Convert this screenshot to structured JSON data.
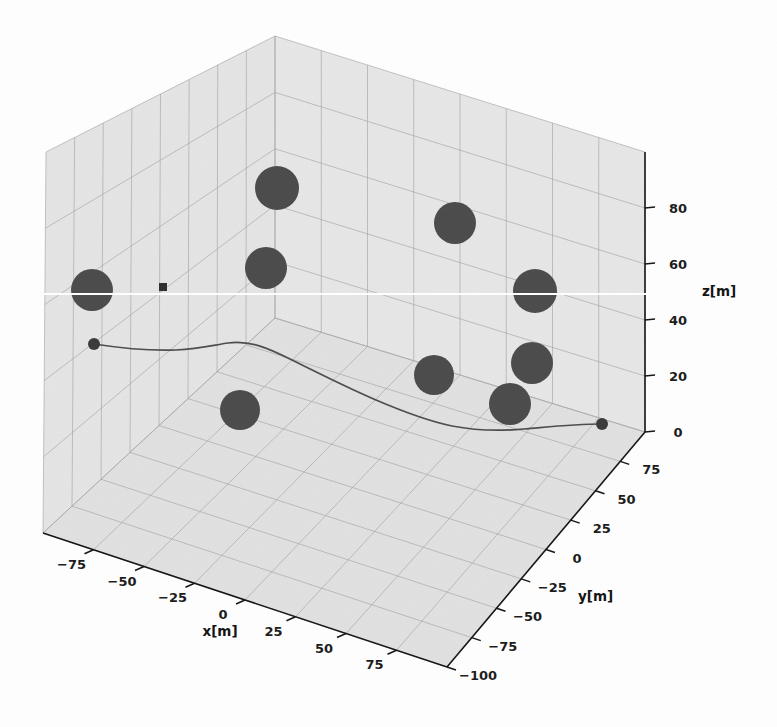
{
  "figure": {
    "kind": "matplotlib-3d-axes",
    "background_color": "#fefefe",
    "pane_color": "#e4e4e4",
    "pane_color_floor": "#e0e0e0",
    "pane_color_back": "#e6e6e6",
    "grid_color": "#9aa0a6",
    "spine_color": "#161616",
    "obstacle_color": "#4b4b4b",
    "trajectory_color": "#4d4d4d",
    "endpoint_color": "#3a3a3a"
  },
  "axes": {
    "x": {
      "title": "x[m]",
      "ticks": [
        -75,
        -50,
        -25,
        0,
        25,
        50,
        75
      ],
      "tick_labels": [
        "−75",
        "−50",
        "−25",
        "0",
        "25",
        "50",
        "75"
      ],
      "range": [
        -100,
        100
      ]
    },
    "y": {
      "title": "y[m]",
      "ticks": [
        -100,
        -75,
        -50,
        -25,
        0,
        25,
        50,
        75
      ],
      "tick_labels": [
        "−100",
        "−75",
        "−50",
        "−25",
        "0",
        "25",
        "50",
        "75"
      ],
      "range": [
        -100,
        100
      ]
    },
    "z": {
      "title": "z[m]",
      "ticks": [
        0,
        20,
        40,
        60,
        80
      ],
      "tick_labels": [
        "0",
        "20",
        "40",
        "60",
        "80"
      ],
      "range": [
        0,
        100
      ]
    }
  },
  "chart_data": {
    "type": "scatter",
    "title": "",
    "xlabel": "x[m]",
    "ylabel": "y[m]",
    "zlabel": "z[m]",
    "xlim": [
      -100,
      100
    ],
    "ylim": [
      -100,
      100
    ],
    "zlim": [
      0,
      100
    ],
    "grid": true,
    "legend": "none",
    "projection": {
      "elev": 22,
      "azim": -60
    },
    "series": [
      {
        "name": "obstacles",
        "marker": "sphere",
        "color": "#4b4b4b",
        "points": [
          {
            "label": "obstacle-1",
            "px": 92,
            "py": 290,
            "pr": 21
          },
          {
            "label": "obstacle-2",
            "px": 277,
            "py": 188,
            "pr": 22
          },
          {
            "label": "obstacle-3",
            "px": 266,
            "py": 268,
            "pr": 21
          },
          {
            "label": "obstacle-4",
            "px": 240,
            "py": 410,
            "pr": 20
          },
          {
            "label": "obstacle-5",
            "px": 455,
            "py": 223,
            "pr": 21
          },
          {
            "label": "obstacle-6",
            "px": 535,
            "py": 291,
            "pr": 22
          },
          {
            "label": "obstacle-7",
            "px": 434,
            "py": 375,
            "pr": 20
          },
          {
            "label": "obstacle-8",
            "px": 532,
            "py": 363,
            "pr": 21
          },
          {
            "label": "obstacle-9",
            "px": 510,
            "py": 404,
            "pr": 21
          }
        ]
      },
      {
        "name": "trajectory",
        "marker": "line",
        "color": "#4d4d4d",
        "path_px": "M 94,344 C 120,348 150,351 176,350 C 200,349 214,345 228,343 C 250,340 268,348 292,360 C 320,374 348,388 376,400 C 404,412 428,421 452,426 C 478,431 502,431 524,429 C 548,427 572,424 602,424"
      },
      {
        "name": "start-point",
        "marker": "o",
        "color": "#3a3a3a",
        "points": [
          {
            "label": "start",
            "px": 94,
            "py": 344,
            "pr": 6
          }
        ]
      },
      {
        "name": "goal-point",
        "marker": "o",
        "color": "#3a3a3a",
        "points": [
          {
            "label": "goal",
            "px": 602,
            "py": 424,
            "pr": 6
          }
        ]
      },
      {
        "name": "waypoint-marker",
        "marker": "s",
        "color": "#2e2e2e",
        "points": [
          {
            "label": "square-marker",
            "px": 163,
            "py": 287,
            "pr": 4
          }
        ]
      }
    ]
  },
  "geometry": {
    "box": {
      "top_back": {
        "x": 275,
        "y": 36
      },
      "top_left": {
        "x": 46,
        "y": 152
      },
      "top_right": {
        "x": 645,
        "y": 152
      },
      "top_front": {
        "x": 447,
        "y": 286
      },
      "bot_left": {
        "x": 43,
        "y": 533
      },
      "bot_right": {
        "x": 645,
        "y": 432
      },
      "bot_front": {
        "x": 447,
        "y": 667
      },
      "bot_back": {
        "x": 275,
        "y": 318
      }
    },
    "x_divisions": 8,
    "y_divisions": 8,
    "z_divisions": 5,
    "scanline_y": 294
  },
  "tick_text": {
    "x": [
      "−75",
      "−50",
      "−25",
      "0",
      "25",
      "50",
      "75"
    ],
    "y": [
      "75",
      "50",
      "25",
      "0",
      "−25",
      "−50",
      "−75",
      "−100"
    ],
    "z": [
      "80",
      "60",
      "40",
      "20",
      "0"
    ]
  },
  "titles": {
    "x": "x[m]",
    "y": "y[m]",
    "z": "z[m]"
  }
}
